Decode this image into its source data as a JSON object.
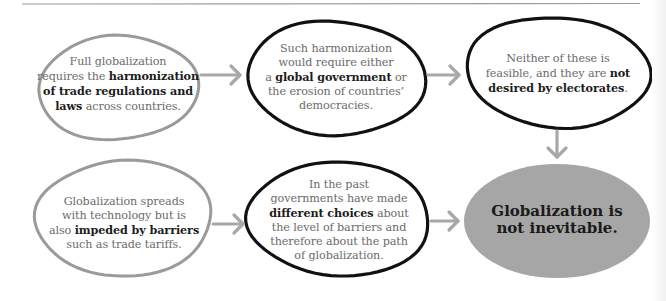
{
  "diagram": {
    "colors": {
      "outline_light": "#9a9a9a",
      "outline_dark": "#111111",
      "arrow": "#a8a8a8",
      "conclusion_fill": "#a6a6a6",
      "text_regular": "#6b6b6b",
      "text_bold": "#1c1c1c"
    },
    "nodes": [
      {
        "id": "full-globalization",
        "style": "light-outline",
        "segments": [
          {
            "text": "Full globalization requires the ",
            "bold": false
          },
          {
            "text": "harmonization of trade regulations and laws",
            "bold": true
          },
          {
            "text": " across countries.",
            "bold": false
          }
        ],
        "lines": [
          [
            {
              "t": "Full globalization",
              "b": false
            }
          ],
          [
            {
              "t": "requires the ",
              "b": false
            },
            {
              "t": "harmonization",
              "b": true
            }
          ],
          [
            {
              "t": "of trade regulations and",
              "b": true
            }
          ],
          [
            {
              "t": "laws",
              "b": true
            },
            {
              "t": " across countries.",
              "b": false
            }
          ]
        ]
      },
      {
        "id": "harmonization-requirement",
        "style": "dark-outline",
        "lines": [
          [
            {
              "t": "Such harmonization",
              "b": false
            }
          ],
          [
            {
              "t": "would require either",
              "b": false
            }
          ],
          [
            {
              "t": "a ",
              "b": false
            },
            {
              "t": "global government",
              "b": true
            },
            {
              "t": " or",
              "b": false
            }
          ],
          [
            {
              "t": "the erosion of countries’",
              "b": false
            }
          ],
          [
            {
              "t": "democracies.",
              "b": false
            }
          ]
        ]
      },
      {
        "id": "not-feasible",
        "style": "dark-outline",
        "lines": [
          [
            {
              "t": "Neither of these is",
              "b": false
            }
          ],
          [
            {
              "t": "feasible, and they are ",
              "b": false
            },
            {
              "t": "not",
              "b": true
            }
          ],
          [
            {
              "t": "desired by electorates",
              "b": true
            },
            {
              "t": ".",
              "b": false
            }
          ]
        ]
      },
      {
        "id": "technology-barriers",
        "style": "light-outline",
        "lines": [
          [
            {
              "t": "Globalization spreads",
              "b": false
            }
          ],
          [
            {
              "t": "with technology but is",
              "b": false
            }
          ],
          [
            {
              "t": "also ",
              "b": false
            },
            {
              "t": "impeded by barriers",
              "b": true
            }
          ],
          [
            {
              "t": "such as trade tariffs.",
              "b": false
            }
          ]
        ]
      },
      {
        "id": "different-choices",
        "style": "dark-outline",
        "lines": [
          [
            {
              "t": "In the past",
              "b": false
            }
          ],
          [
            {
              "t": "governments have made",
              "b": false
            }
          ],
          [
            {
              "t": "different choices",
              "b": true
            },
            {
              "t": " about",
              "b": false
            }
          ],
          [
            {
              "t": "the level of barriers and",
              "b": false
            }
          ],
          [
            {
              "t": "therefore about the path",
              "b": false
            }
          ],
          [
            {
              "t": "of globalization.",
              "b": false
            }
          ]
        ]
      },
      {
        "id": "conclusion",
        "style": "filled",
        "lines": [
          [
            {
              "t": "Globalization is",
              "b": true
            }
          ],
          [
            {
              "t": "not inevitable.",
              "b": true
            }
          ]
        ]
      }
    ],
    "edges": [
      {
        "from": "full-globalization",
        "to": "harmonization-requirement",
        "direction": "right"
      },
      {
        "from": "harmonization-requirement",
        "to": "not-feasible",
        "direction": "right"
      },
      {
        "from": "not-feasible",
        "to": "conclusion",
        "direction": "down"
      },
      {
        "from": "technology-barriers",
        "to": "different-choices",
        "direction": "right"
      },
      {
        "from": "different-choices",
        "to": "conclusion",
        "direction": "right"
      }
    ]
  }
}
